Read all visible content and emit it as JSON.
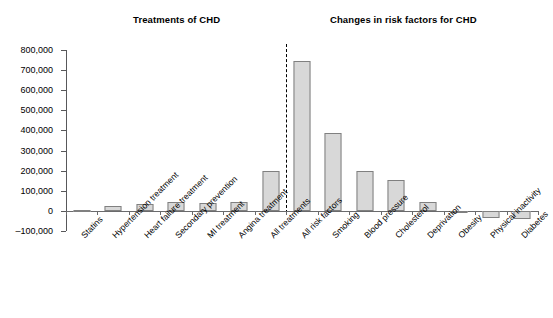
{
  "panels": {
    "left_title": "Treatments of CHD",
    "right_title": "Changes in risk factors for CHD"
  },
  "chart_data": {
    "type": "bar",
    "title": "",
    "xlabel": "",
    "ylabel": "",
    "ylim": [
      -100000,
      800000
    ],
    "ytick_values": [
      800000,
      700000,
      600000,
      500000,
      400000,
      300000,
      200000,
      100000,
      0,
      -100000
    ],
    "ytick_labels": [
      "800,000",
      "700,000",
      "600,000",
      "500,000",
      "400,000",
      "300,000",
      "200,000",
      "100,000",
      "0",
      "–100,000"
    ],
    "grid": false,
    "legend": "none",
    "bar_fill_color": "#d8d8d8",
    "bar_edge_color": "#808080",
    "divider_after_category": "All treatments",
    "divider_style": "dashed",
    "categories": [
      "Statins",
      "Hypertension treatment",
      "Heart failure treatment",
      "Secondary prevention",
      "MI treatment",
      "Angina treatment",
      "All treatments",
      "All risk factors",
      "Smoking",
      "Blood pressure",
      "Cholesterol",
      "Deprivation",
      "Obesity",
      "Physical inactivity",
      "Diabetes"
    ],
    "values": [
      4000,
      22000,
      32000,
      42000,
      38000,
      46000,
      196000,
      745000,
      385000,
      196000,
      155000,
      45000,
      -10000,
      -37000,
      -40000
    ],
    "groups": [
      {
        "name": "Treatments of CHD",
        "categories": [
          "Statins",
          "Hypertension treatment",
          "Heart failure treatment",
          "Secondary prevention",
          "MI treatment",
          "Angina treatment",
          "All treatments"
        ]
      },
      {
        "name": "Changes in risk factors for CHD",
        "categories": [
          "All risk factors",
          "Smoking",
          "Blood pressure",
          "Cholesterol",
          "Deprivation",
          "Obesity",
          "Physical inactivity",
          "Diabetes"
        ]
      }
    ]
  }
}
